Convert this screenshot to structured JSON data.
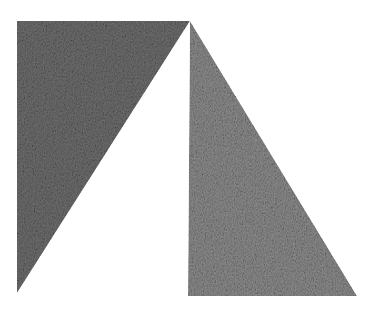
{
  "canvas": {
    "width": 382,
    "height": 311,
    "background": "#ffffff"
  },
  "shapes": [
    {
      "name": "left-triangle",
      "points": "17,21 190,21 17,293",
      "base_color": "#6e6e6e",
      "texture": "pencil-hatch"
    },
    {
      "name": "right-triangle",
      "points": "190,21 188,296 357,296",
      "base_color": "#8c8c8c",
      "texture": "pencil-hatch"
    }
  ]
}
